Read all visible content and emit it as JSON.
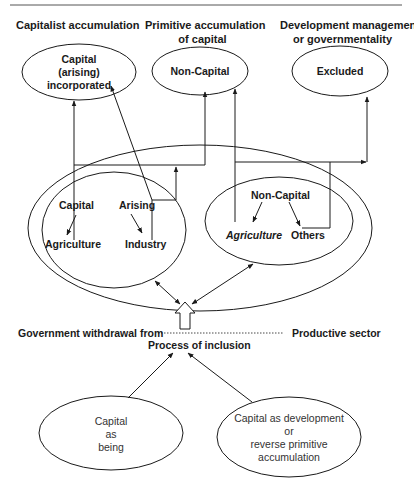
{
  "headers": {
    "left": "Capitalist accumulation",
    "middle_line1": "Primitive accumulation",
    "middle_line2": "of capital",
    "right_line1": "Development management",
    "right_line2": "or governmentality"
  },
  "top_nodes": {
    "capital_incorporated": [
      "Capital",
      "(arising)",
      "incorporated"
    ],
    "non_capital": "Non-Capital",
    "excluded": "Excluded"
  },
  "left_inner": {
    "capital": "Capital",
    "arising": "Arising",
    "agriculture": "Agriculture",
    "industry": "Industry"
  },
  "right_inner": {
    "non_capital": "Non-Capital",
    "agriculture": "Agriculture",
    "others": "Others"
  },
  "middle_row": {
    "left": "Government withdrawal from",
    "right": "Productive sector",
    "process": "Process of inclusion"
  },
  "bottom_nodes": {
    "capital_as_being": [
      "Capital",
      "as",
      "being"
    ],
    "capital_as_development": [
      "Capital as development",
      "or",
      "reverse primitive",
      "accumulation"
    ]
  }
}
